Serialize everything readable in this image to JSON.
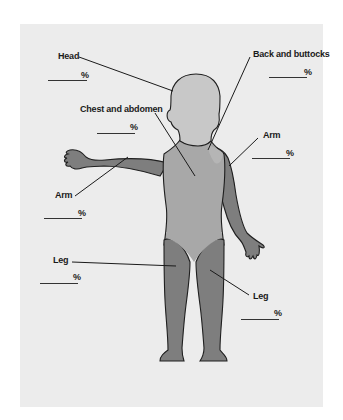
{
  "diagram": {
    "type": "body-surface-area-chart",
    "colors": {
      "background": "#ececec",
      "head_region": "#c8c8c8",
      "trunk_region": "#a8a8a8",
      "limb_region": "#7e7e7e",
      "outline": "#1f1f1f"
    },
    "regions": [
      {
        "id": "head",
        "label": "Head",
        "percent_symbol": "%",
        "value": ""
      },
      {
        "id": "back",
        "label": "Back and buttocks",
        "percent_symbol": "%",
        "value": ""
      },
      {
        "id": "chest",
        "label": "Chest and abdomen",
        "percent_symbol": "%",
        "value": ""
      },
      {
        "id": "arm_right",
        "label": "Arm",
        "percent_symbol": "%",
        "value": ""
      },
      {
        "id": "arm_left",
        "label": "Arm",
        "percent_symbol": "%",
        "value": ""
      },
      {
        "id": "leg_left",
        "label": "Leg",
        "percent_symbol": "%",
        "value": ""
      },
      {
        "id": "leg_right",
        "label": "Leg",
        "percent_symbol": "%",
        "value": ""
      }
    ]
  }
}
